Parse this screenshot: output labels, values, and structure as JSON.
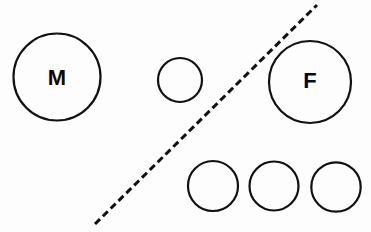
{
  "figure": {
    "background_color": "#fdfdfd",
    "stroke_color": "#111111",
    "label_color": "#0a0a0a",
    "width": 371,
    "height": 232
  },
  "diagram": {
    "divider": {
      "name": "dashed-diagonal-divider",
      "style": "dashed",
      "x1": 95,
      "y1": 224,
      "x2": 317,
      "y2": 5,
      "stroke_width": 3,
      "dash_pattern": "7 4"
    },
    "circles": [
      {
        "id": "circle-m",
        "label": "M",
        "cx": 57,
        "cy": 77,
        "r": 43.5,
        "side": "left",
        "labeled": true
      },
      {
        "id": "circle-small-left",
        "label": "",
        "cx": 180,
        "cy": 80,
        "r": 22,
        "side": "left",
        "labeled": false
      },
      {
        "id": "circle-f",
        "label": "F",
        "cx": 310,
        "cy": 82,
        "r": 41,
        "side": "right",
        "labeled": true
      },
      {
        "id": "circle-bottom-1",
        "label": "",
        "cx": 213,
        "cy": 186,
        "r": 25,
        "side": "right",
        "labeled": false
      },
      {
        "id": "circle-bottom-2",
        "label": "",
        "cx": 274,
        "cy": 186,
        "r": 24.5,
        "side": "right",
        "labeled": false
      },
      {
        "id": "circle-bottom-3",
        "label": "",
        "cx": 336,
        "cy": 187,
        "r": 24.7,
        "side": "right",
        "labeled": false
      }
    ],
    "labels": [
      {
        "text": "M",
        "x": 57,
        "y": 77,
        "font_size": 22
      },
      {
        "text": "F",
        "x": 310,
        "y": 80,
        "font_size": 22
      }
    ]
  }
}
